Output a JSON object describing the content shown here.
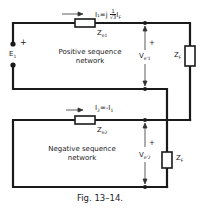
{
  "figure": {
    "caption": "Fig. 13–14.",
    "positive_network": {
      "label_line1": "Positive sequence",
      "label_line2": "network",
      "current": "I₁=j (1/√3) I_F",
      "current_text": "I₁=j",
      "current_frac_num": "1",
      "current_frac_den": "√3",
      "current_tail": "I",
      "current_tail_sub": "F",
      "impedance": "Z",
      "impedance_sub": "e1",
      "voltage": "V",
      "voltage_sub": "e'1",
      "voltage_sign": "+",
      "source": "E",
      "source_sub": "1",
      "source_sign": "+"
    },
    "negative_network": {
      "label_line1": "Negative sequence",
      "label_line2": "network",
      "current": "I₂=-I₁",
      "current_text": "I",
      "current_sub": "2",
      "current_rest": "=-I",
      "current_rest_sub": "1",
      "impedance": "Z",
      "impedance_sub": "e2",
      "voltage": "V",
      "voltage_sub": "e'2",
      "voltage_sign": "+"
    },
    "fault_impedance_top": {
      "label": "Z",
      "sub": "F"
    },
    "fault_impedance_bottom": {
      "label": "Z",
      "sub": "F"
    }
  },
  "colors": {
    "line": "#1a1a1a",
    "text": "#222222"
  }
}
